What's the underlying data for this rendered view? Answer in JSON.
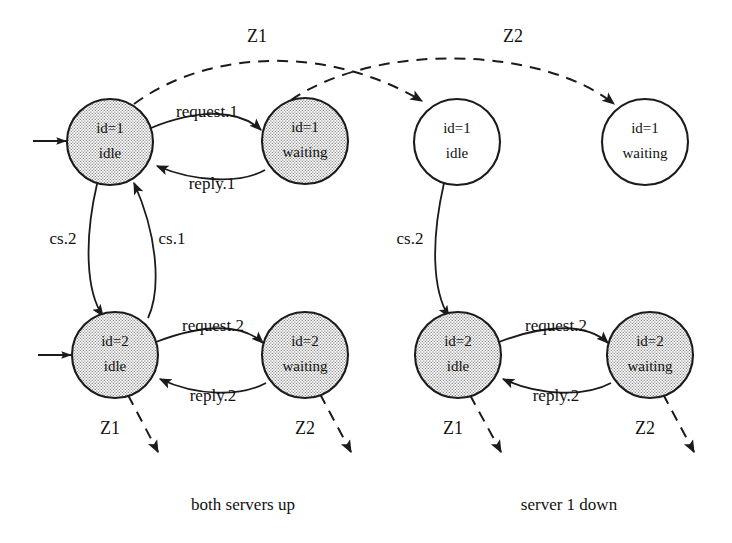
{
  "figure": {
    "background_color": "#ffffff",
    "ink_color": "#1b1b1b"
  },
  "panels": [
    {
      "id": "panel-both-up",
      "caption": "both servers up",
      "caption_x": 243,
      "caption_y": 506
    },
    {
      "id": "panel-server1-down",
      "caption": "server 1 down",
      "caption_x": 569,
      "caption_y": 506
    }
  ],
  "nodes": [
    {
      "id": "n1",
      "line1": "id=1",
      "line2": "idle",
      "cx": 110,
      "cy": 142,
      "r": 43,
      "style": "filled",
      "panel": "panel-both-up"
    },
    {
      "id": "n2",
      "line1": "id=1",
      "line2": "waiting",
      "cx": 305,
      "cy": 141,
      "r": 43,
      "style": "filled",
      "panel": "panel-both-up"
    },
    {
      "id": "n3",
      "line1": "id=2",
      "line2": "idle",
      "cx": 115,
      "cy": 355,
      "r": 43,
      "style": "filled",
      "panel": "panel-both-up"
    },
    {
      "id": "n4",
      "line1": "id=2",
      "line2": "waiting",
      "cx": 305,
      "cy": 355,
      "r": 43,
      "style": "filled",
      "panel": "panel-both-up"
    },
    {
      "id": "n5",
      "line1": "id=1",
      "line2": "idle",
      "cx": 457,
      "cy": 142,
      "r": 43,
      "style": "open",
      "panel": "panel-server1-down"
    },
    {
      "id": "n6",
      "line1": "id=1",
      "line2": "waiting",
      "cx": 645,
      "cy": 142,
      "r": 43,
      "style": "open",
      "panel": "panel-server1-down"
    },
    {
      "id": "n7",
      "line1": "id=2",
      "line2": "idle",
      "cx": 458,
      "cy": 355,
      "r": 43,
      "style": "filled",
      "panel": "panel-server1-down"
    },
    {
      "id": "n8",
      "line1": "id=2",
      "line2": "waiting",
      "cx": 650,
      "cy": 355,
      "r": 43,
      "style": "filled",
      "panel": "panel-server1-down"
    }
  ],
  "edges": [
    {
      "id": "e-request1",
      "label": "request.1",
      "from": "n1",
      "to": "n2",
      "style": "solid",
      "label_x": 207,
      "label_y": 113
    },
    {
      "id": "e-reply1",
      "label": "reply.1",
      "from": "n2",
      "to": "n1",
      "style": "solid",
      "label_x": 212,
      "label_y": 185
    },
    {
      "id": "e-cs2-left",
      "label": "cs.2",
      "from": "n1",
      "to": "n3",
      "style": "solid",
      "label_x": 63,
      "label_y": 240
    },
    {
      "id": "e-cs1-left",
      "label": "cs.1",
      "from": "n3",
      "to": "n1",
      "style": "solid",
      "label_x": 172,
      "label_y": 240
    },
    {
      "id": "e-request2-left",
      "label": "request.2",
      "from": "n3",
      "to": "n4",
      "style": "solid",
      "label_x": 213,
      "label_y": 327
    },
    {
      "id": "e-reply2-left",
      "label": "reply.2",
      "from": "n4",
      "to": "n3",
      "style": "solid",
      "label_x": 213,
      "label_y": 397
    },
    {
      "id": "e-cs2-right",
      "label": "cs.2",
      "from": "n5",
      "to": "n7",
      "style": "solid",
      "label_x": 410,
      "label_y": 240
    },
    {
      "id": "e-request2-right",
      "label": "request.2",
      "from": "n7",
      "to": "n8",
      "style": "solid",
      "label_x": 556,
      "label_y": 327
    },
    {
      "id": "e-reply2-right",
      "label": "reply.2",
      "from": "n8",
      "to": "n7",
      "style": "solid",
      "label_x": 556,
      "label_y": 397
    }
  ],
  "zone_transitions": [
    {
      "id": "z1-top",
      "label": "Z1",
      "label_x": 257,
      "label_y": 38,
      "from": "n1",
      "to": "n5",
      "style": "dashed"
    },
    {
      "id": "z2-top",
      "label": "Z2",
      "label_x": 513,
      "label_y": 38,
      "from": "n2",
      "to": "n6",
      "style": "dashed"
    },
    {
      "id": "z1-bottom-left",
      "label": "Z1",
      "label_x": 110,
      "label_y": 430,
      "style": "dashed"
    },
    {
      "id": "z2-bottom-left",
      "label": "Z2",
      "label_x": 305,
      "label_y": 430,
      "style": "dashed"
    },
    {
      "id": "z1-bottom-right",
      "label": "Z1",
      "label_x": 453,
      "label_y": 430,
      "style": "dashed"
    },
    {
      "id": "z2-bottom-right",
      "label": "Z2",
      "label_x": 645,
      "label_y": 430,
      "style": "dashed"
    }
  ],
  "initial_markers": [
    {
      "id": "init-n1",
      "target": "n1",
      "x1": 33,
      "y1": 141,
      "x2": 66,
      "y2": 141
    },
    {
      "id": "init-n3",
      "target": "n3",
      "x1": 38,
      "y1": 355,
      "x2": 71,
      "y2": 355
    }
  ]
}
